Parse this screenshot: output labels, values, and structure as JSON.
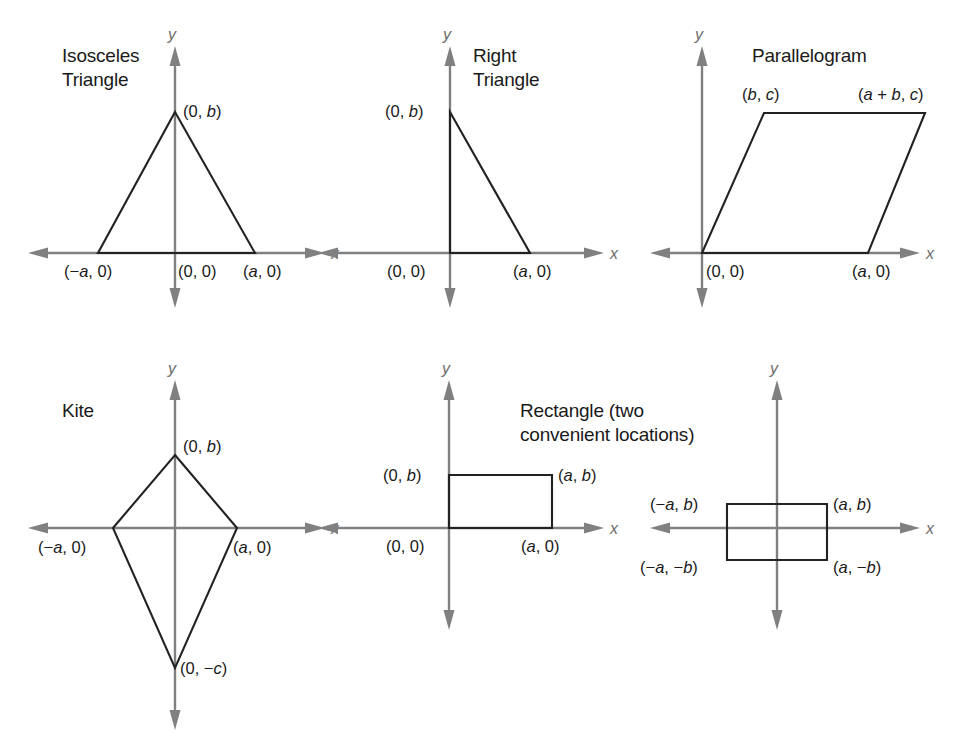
{
  "figure": {
    "background_color": "#ffffff",
    "axis_color": "#808080",
    "shape_color": "#222222",
    "text_color": "#1a1a1a",
    "axis_x_name": "x",
    "axis_y_name": "y"
  },
  "panels": [
    {
      "id": "isosceles-triangle",
      "title_lines": [
        "Isosceles",
        "Triangle"
      ],
      "shape_type": "triangle",
      "vertices": [
        {
          "label_parts": [
            "(0, ",
            "b",
            ")"
          ],
          "label_text": "(0, b)"
        },
        {
          "label_parts": [
            "(",
            "a",
            ", 0)"
          ],
          "label_text": "(a, 0)"
        },
        {
          "label_parts": [
            "(−",
            "a",
            ", 0)"
          ],
          "label_text": "(−a, 0)"
        }
      ],
      "origin_label": "(0, 0)"
    },
    {
      "id": "right-triangle",
      "title_lines": [
        "Right",
        "Triangle"
      ],
      "shape_type": "triangle",
      "vertices": [
        {
          "label_parts": [
            "(0, ",
            "b",
            ")"
          ],
          "label_text": "(0, b)"
        },
        {
          "label_parts": [
            "(",
            "a",
            ", 0)"
          ],
          "label_text": "(a, 0)"
        }
      ],
      "origin_label": "(0, 0)"
    },
    {
      "id": "parallelogram",
      "title_lines": [
        "Parallelogram"
      ],
      "shape_type": "parallelogram",
      "vertices": [
        {
          "label_parts": [
            "(",
            "b",
            ", ",
            "c",
            ")"
          ],
          "label_text": "(b, c)"
        },
        {
          "label_parts": [
            "(",
            "a",
            " + ",
            "b",
            ", ",
            "c",
            ")"
          ],
          "label_text": "(a + b, c)"
        },
        {
          "label_parts": [
            "(",
            "a",
            ", 0)"
          ],
          "label_text": "(a, 0)"
        }
      ],
      "origin_label": "(0, 0)"
    },
    {
      "id": "kite",
      "title_lines": [
        "Kite"
      ],
      "shape_type": "kite",
      "vertices": [
        {
          "label_parts": [
            "(0, ",
            "b",
            ")"
          ],
          "label_text": "(0, b)"
        },
        {
          "label_parts": [
            "(",
            "a",
            ", 0)"
          ],
          "label_text": "(a, 0)"
        },
        {
          "label_parts": [
            "(−",
            "a",
            ", 0)"
          ],
          "label_text": "(−a, 0)"
        },
        {
          "label_parts": [
            "(0, −",
            "c",
            ")"
          ],
          "label_text": "(0, −c)"
        }
      ],
      "origin_label": ""
    },
    {
      "id": "rectangle-first-quadrant",
      "title_lines": [
        "Rectangle (two",
        "convenient locations)"
      ],
      "shape_type": "rectangle",
      "vertices": [
        {
          "label_parts": [
            "(0, ",
            "b",
            ")"
          ],
          "label_text": "(0, b)"
        },
        {
          "label_parts": [
            "(",
            "a",
            ", ",
            "b",
            ")"
          ],
          "label_text": "(a, b)"
        },
        {
          "label_parts": [
            "(",
            "a",
            ", 0)"
          ],
          "label_text": "(a, 0)"
        }
      ],
      "origin_label": "(0, 0)"
    },
    {
      "id": "rectangle-centered",
      "title_lines": [],
      "shape_type": "rectangle",
      "vertices": [
        {
          "label_parts": [
            "(−",
            "a",
            ", ",
            "b",
            ")"
          ],
          "label_text": "(−a, b)"
        },
        {
          "label_parts": [
            "(",
            "a",
            ", ",
            "b",
            ")"
          ],
          "label_text": "(a, b)"
        },
        {
          "label_parts": [
            "(−",
            "a",
            ", −",
            "b",
            ")"
          ],
          "label_text": "(−a, −b)"
        },
        {
          "label_parts": [
            "(",
            "a",
            ", −",
            "b",
            ")"
          ],
          "label_text": "(a, −b)"
        }
      ],
      "origin_label": ""
    }
  ],
  "chart_data": {
    "type": "diagram",
    "figures": [
      {
        "name": "Isosceles Triangle",
        "points": [
          {
            "name": "apex",
            "coords": "(0, b)"
          },
          {
            "name": "left-base",
            "coords": "(-a, 0)"
          },
          {
            "name": "right-base",
            "coords": "(a, 0)"
          },
          {
            "name": "origin",
            "coords": "(0, 0)"
          }
        ]
      },
      {
        "name": "Right Triangle",
        "points": [
          {
            "name": "top",
            "coords": "(0, b)"
          },
          {
            "name": "origin",
            "coords": "(0, 0)"
          },
          {
            "name": "right",
            "coords": "(a, 0)"
          }
        ]
      },
      {
        "name": "Parallelogram",
        "points": [
          {
            "name": "origin",
            "coords": "(0, 0)"
          },
          {
            "name": "bottom-right",
            "coords": "(a, 0)"
          },
          {
            "name": "top-right",
            "coords": "(a + b, c)"
          },
          {
            "name": "top-left",
            "coords": "(b, c)"
          }
        ]
      },
      {
        "name": "Kite",
        "points": [
          {
            "name": "top",
            "coords": "(0, b)"
          },
          {
            "name": "right",
            "coords": "(a, 0)"
          },
          {
            "name": "bottom",
            "coords": "(0, -c)"
          },
          {
            "name": "left",
            "coords": "(-a, 0)"
          }
        ]
      },
      {
        "name": "Rectangle (first quadrant)",
        "points": [
          {
            "name": "origin",
            "coords": "(0, 0)"
          },
          {
            "name": "bottom-right",
            "coords": "(a, 0)"
          },
          {
            "name": "top-right",
            "coords": "(a, b)"
          },
          {
            "name": "top-left",
            "coords": "(0, b)"
          }
        ]
      },
      {
        "name": "Rectangle (centered at origin)",
        "points": [
          {
            "name": "top-left",
            "coords": "(-a, b)"
          },
          {
            "name": "top-right",
            "coords": "(a, b)"
          },
          {
            "name": "bottom-left",
            "coords": "(-a, -b)"
          },
          {
            "name": "bottom-right",
            "coords": "(a, -b)"
          }
        ]
      }
    ]
  }
}
